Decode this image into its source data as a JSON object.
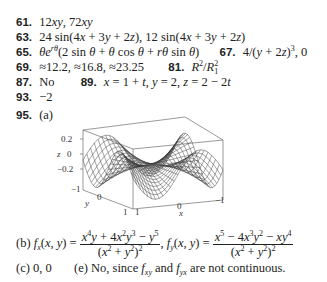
{
  "answers": [
    {
      "num": "61.",
      "text": "12xy, 72xy"
    },
    {
      "num": "63.",
      "text": "24 sin(4x + 3y + 2z), 12 sin(4x + 3y + 2z)"
    },
    {
      "num": "65.",
      "text": "θe^{rθ}(2 sin θ + θ cos θ + rθ sin θ)"
    },
    {
      "num": "67.",
      "text": "4/(y + 2z)^3, 0"
    },
    {
      "num": "69.",
      "text": "≈12.2, ≈16.8, ≈23.25"
    },
    {
      "num": "81.",
      "text": "R^2/R_1^2"
    },
    {
      "num": "87.",
      "text": "No"
    },
    {
      "num": "89.",
      "text": "x = 1 + t, y = 2, z = 2 − 2t"
    },
    {
      "num": "93.",
      "text": "−2"
    },
    {
      "num": "95.",
      "text": "(a)"
    }
  ],
  "plot": {
    "z_label": "z",
    "y_label": "y",
    "x_label": "x",
    "z_ticks": [
      "0.2",
      "0",
      "−0.2"
    ],
    "y_ticks": [
      "−1",
      "0",
      "1"
    ],
    "x_ticks": [
      "1",
      "0",
      "−1"
    ]
  },
  "part_b": {
    "label": "(b)",
    "fx_lhs": "f_x(x, y) =",
    "fx_num": "x^4y + 4x^2y^3 − y^5",
    "fx_den": "(x^2 + y^2)^2",
    "fy_lhs": "f_y(x, y) =",
    "fy_num": "x^5 − 4x^3y^2 − xy^4",
    "fy_den": "(x^2 + y^2)^2"
  },
  "part_c": {
    "label": "(c)",
    "text": "0, 0"
  },
  "part_e": {
    "label": "(e)",
    "text": "No, since f_xy and f_yx are not continuous."
  }
}
